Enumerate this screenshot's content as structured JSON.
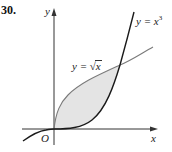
{
  "problem_number": "30.",
  "axes": {
    "y_label": "y",
    "x_label": "x",
    "origin_label": "O"
  },
  "curves": [
    {
      "name": "cube",
      "label_prefix": "y = ",
      "label_var": "x",
      "label_exp": "3",
      "expression": "y = x^3"
    },
    {
      "name": "sqrt",
      "label_prefix": "y = ",
      "label_radical": "√",
      "label_var": "x",
      "expression": "y = sqrt(x)"
    }
  ],
  "shaded_region": "area between y = sqrt(x) and y = x^3 from x = 0 to x = 1",
  "colors": {
    "curve": "#1a1a1a",
    "secondary_curve": "#7a7a7a",
    "axis": "#333333",
    "shade": "#e4e4e4"
  }
}
